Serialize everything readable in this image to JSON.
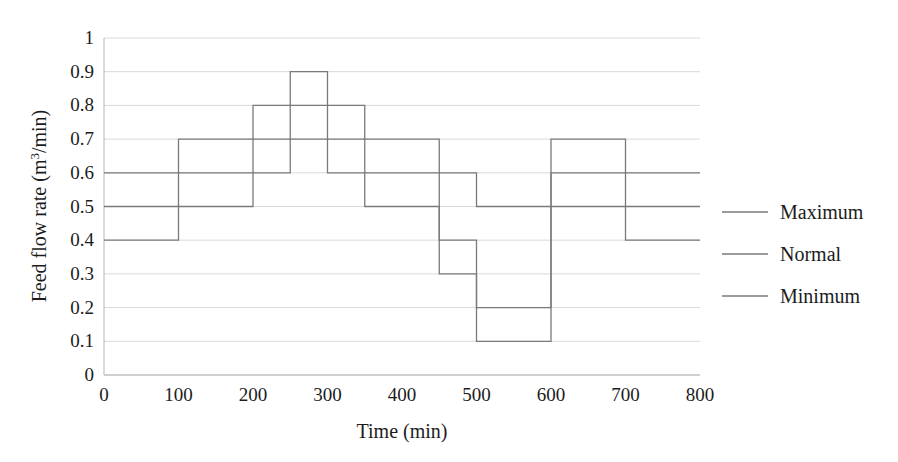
{
  "chart_data": {
    "type": "line",
    "subtype": "step",
    "title": "",
    "xlabel": "Time (min)",
    "ylabel": "Feed flow rate (m3/min)",
    "ylabel_parts": {
      "prefix": "Feed flow rate (m",
      "superscript": "3",
      "suffix": "/min)"
    },
    "xlim": [
      0,
      800
    ],
    "ylim": [
      0,
      1
    ],
    "xticks": [
      0,
      100,
      200,
      300,
      400,
      500,
      600,
      700,
      800
    ],
    "xtick_labels": [
      "0",
      "100",
      "200",
      "300",
      "400",
      "500",
      "600",
      "700",
      "800"
    ],
    "yticks": [
      0,
      0.1,
      0.2,
      0.3,
      0.4,
      0.5,
      0.6,
      0.7,
      0.8,
      0.9,
      1
    ],
    "ytick_labels": [
      "0",
      "0.1",
      "0.2",
      "0.3",
      "0.4",
      "0.5",
      "0.6",
      "0.7",
      "0.8",
      "0.9",
      "1"
    ],
    "grid": "horizontal",
    "legend_position": "right",
    "legend_entries": [
      "Maximum",
      "Normal",
      "Minimum"
    ],
    "step_edges": [
      0,
      100,
      200,
      250,
      300,
      350,
      450,
      500,
      600,
      700,
      800
    ],
    "series": [
      {
        "name": "Maximum",
        "color": "#7a7a7a",
        "values": [
          0.6,
          0.7,
          0.8,
          0.9,
          0.8,
          0.7,
          0.6,
          0.5,
          0.7,
          0.6
        ],
        "points": [
          {
            "x_start": 0,
            "x_end": 100,
            "y": 0.6
          },
          {
            "x_start": 100,
            "x_end": 200,
            "y": 0.7
          },
          {
            "x_start": 200,
            "x_end": 250,
            "y": 0.8
          },
          {
            "x_start": 250,
            "x_end": 300,
            "y": 0.9
          },
          {
            "x_start": 300,
            "x_end": 350,
            "y": 0.8
          },
          {
            "x_start": 350,
            "x_end": 450,
            "y": 0.7
          },
          {
            "x_start": 450,
            "x_end": 500,
            "y": 0.6
          },
          {
            "x_start": 500,
            "x_end": 600,
            "y": 0.5
          },
          {
            "x_start": 600,
            "x_end": 700,
            "y": 0.7
          },
          {
            "x_start": 700,
            "x_end": 800,
            "y": 0.6
          }
        ]
      },
      {
        "name": "Normal",
        "color": "#7a7a7a",
        "values": [
          0.5,
          0.6,
          0.7,
          0.8,
          0.7,
          0.6,
          0.5,
          0.4,
          0.3,
          0.2,
          0.6,
          0.5
        ],
        "points": [
          {
            "x_start": 0,
            "x_end": 100,
            "y": 0.5
          },
          {
            "x_start": 100,
            "x_end": 200,
            "y": 0.6
          },
          {
            "x_start": 200,
            "x_end": 250,
            "y": 0.7
          },
          {
            "x_start": 250,
            "x_end": 300,
            "y": 0.8
          },
          {
            "x_start": 300,
            "x_end": 350,
            "y": 0.7
          },
          {
            "x_start": 350,
            "x_end": 450,
            "y": 0.6
          },
          {
            "x_start": 450,
            "x_end": 500,
            "y": 0.4
          },
          {
            "x_start": 500,
            "x_end": 600,
            "y": 0.2
          },
          {
            "x_start": 600,
            "x_end": 700,
            "y": 0.6
          },
          {
            "x_start": 700,
            "x_end": 800,
            "y": 0.5
          }
        ]
      },
      {
        "name": "Minimum",
        "color": "#7a7a7a",
        "values": [
          0.4,
          0.5,
          0.6,
          0.7,
          0.6,
          0.5,
          0.4,
          0.3,
          0.1,
          0.5,
          0.4
        ],
        "points": [
          {
            "x_start": 0,
            "x_end": 100,
            "y": 0.4
          },
          {
            "x_start": 100,
            "x_end": 200,
            "y": 0.5
          },
          {
            "x_start": 200,
            "x_end": 250,
            "y": 0.6
          },
          {
            "x_start": 250,
            "x_end": 300,
            "y": 0.7
          },
          {
            "x_start": 300,
            "x_end": 350,
            "y": 0.6
          },
          {
            "x_start": 350,
            "x_end": 450,
            "y": 0.5
          },
          {
            "x_start": 450,
            "x_end": 500,
            "y": 0.3
          },
          {
            "x_start": 500,
            "x_end": 600,
            "y": 0.1
          },
          {
            "x_start": 600,
            "x_end": 700,
            "y": 0.5
          },
          {
            "x_start": 700,
            "x_end": 800,
            "y": 0.4
          }
        ]
      }
    ]
  },
  "axes": {
    "x_title": "Time (min)",
    "y_title_prefix": "Feed flow rate (m",
    "y_title_sup": "3",
    "y_title_suffix": "/min)"
  },
  "ticks": {
    "x": [
      "0",
      "100",
      "200",
      "300",
      "400",
      "500",
      "600",
      "700",
      "800"
    ],
    "y": [
      "1",
      "0.9",
      "0.8",
      "0.7",
      "0.6",
      "0.5",
      "0.4",
      "0.3",
      "0.2",
      "0.1",
      "0"
    ]
  },
  "legend": {
    "items": [
      {
        "label": "Maximum"
      },
      {
        "label": "Normal"
      },
      {
        "label": "Minimum"
      }
    ]
  },
  "colors": {
    "series_line": "#7a7a7a",
    "gridline": "#d9d9d9",
    "axis": "#b5b5b5",
    "text": "#1c1c1c",
    "background": "#ffffff"
  }
}
